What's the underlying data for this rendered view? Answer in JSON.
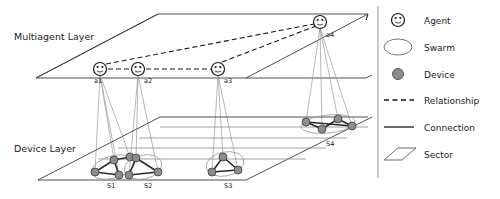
{
  "diagram": {
    "layers": [
      {
        "id": "multiagent",
        "label": "Multiagent Layer"
      },
      {
        "id": "device",
        "label": "Device Layer"
      }
    ],
    "agents": [
      {
        "id": "a1",
        "label": "a1",
        "x": 100,
        "y": 69
      },
      {
        "id": "a2",
        "label": "a2",
        "x": 138,
        "y": 69
      },
      {
        "id": "a3",
        "label": "a3",
        "x": 218,
        "y": 69
      },
      {
        "id": "a4",
        "label": "a4",
        "x": 320,
        "y": 22
      }
    ],
    "sectors": [
      {
        "id": "S1",
        "label": "S1",
        "x": 113,
        "y": 185
      },
      {
        "id": "S2",
        "label": "S2",
        "x": 150,
        "y": 185
      },
      {
        "id": "S3",
        "label": "S3",
        "x": 230,
        "y": 185
      },
      {
        "id": "S4",
        "label": "S4",
        "x": 332,
        "y": 145
      }
    ],
    "swarms": [
      {
        "id": "swarm-s1",
        "sector": "S1",
        "devices": [
          {
            "id": "d1",
            "x": 95,
            "y": 172
          },
          {
            "id": "d2",
            "x": 114,
            "y": 160
          },
          {
            "id": "d3",
            "x": 130,
            "y": 157
          },
          {
            "id": "d4",
            "x": 119,
            "y": 175
          }
        ],
        "links": [
          [
            0,
            1
          ],
          [
            1,
            2
          ],
          [
            1,
            3
          ],
          [
            0,
            3
          ]
        ]
      },
      {
        "id": "swarm-s2",
        "sector": "S2",
        "devices": [
          {
            "id": "d5",
            "x": 136,
            "y": 158
          },
          {
            "id": "d6",
            "x": 129,
            "y": 175
          },
          {
            "id": "d7",
            "x": 158,
            "y": 172
          }
        ],
        "links": [
          [
            0,
            1
          ],
          [
            1,
            2
          ],
          [
            0,
            2
          ]
        ]
      },
      {
        "id": "swarm-s3",
        "sector": "S3",
        "devices": [
          {
            "id": "d8",
            "x": 223,
            "y": 157
          },
          {
            "id": "d9",
            "x": 212,
            "y": 172
          },
          {
            "id": "d10",
            "x": 238,
            "y": 170
          }
        ],
        "links": [
          [
            0,
            1
          ],
          [
            1,
            2
          ],
          [
            0,
            2
          ]
        ]
      },
      {
        "id": "swarm-s4",
        "sector": "S4",
        "devices": [
          {
            "id": "d11",
            "x": 306,
            "y": 122
          },
          {
            "id": "d12",
            "x": 322,
            "y": 129
          },
          {
            "id": "d13",
            "x": 338,
            "y": 119
          },
          {
            "id": "d14",
            "x": 352,
            "y": 126
          }
        ],
        "links": [
          [
            0,
            1
          ],
          [
            1,
            2
          ],
          [
            2,
            3
          ],
          [
            0,
            3
          ]
        ]
      }
    ],
    "relationships": [
      {
        "from": "a1",
        "to": "a2"
      },
      {
        "from": "a2",
        "to": "a3"
      },
      {
        "from": "a1",
        "to": "a4"
      },
      {
        "from": "a3",
        "to": "a4"
      }
    ]
  },
  "legend": {
    "title": "Legend",
    "items": [
      {
        "id": "agent",
        "label": "Agent",
        "symbol": "agent-icon"
      },
      {
        "id": "swarm",
        "label": "Swarm",
        "symbol": "swarm-ellipse-icon"
      },
      {
        "id": "device",
        "label": "Device",
        "symbol": "device-dot-icon"
      },
      {
        "id": "relationship",
        "label": "Relationship",
        "symbol": "dashed-line-icon"
      },
      {
        "id": "connection",
        "label": "Connection",
        "symbol": "solid-line-icon"
      },
      {
        "id": "sector",
        "label": "Sector",
        "symbol": "parallelogram-icon"
      }
    ]
  },
  "colors": {
    "stroke_dark": "#1a1a1a",
    "stroke_plane": "#3a3a3a",
    "stroke_light": "#9a9a9a",
    "device_fill": "#8d8d8d",
    "background": "#ffffff"
  }
}
